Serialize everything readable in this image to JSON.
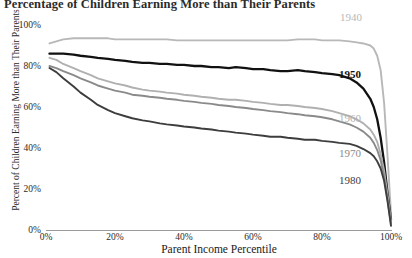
{
  "chart_data": {
    "type": "line",
    "title": "Percentage of Children Earning More than Their Parents",
    "xlabel": "Parent Income Percentile",
    "ylabel": "Percent of Children Earning More than Their Parents",
    "xlim": [
      0,
      100
    ],
    "ylim": [
      0,
      100
    ],
    "grid": false,
    "legend_position": "inline-right",
    "x_ticks": [
      "0%",
      "20%",
      "40%",
      "60%",
      "80%",
      "100%"
    ],
    "x_tick_values": [
      0,
      20,
      40,
      60,
      80,
      100
    ],
    "y_ticks": [
      "0%",
      "20%",
      "40%",
      "60%",
      "80%",
      "100%"
    ],
    "y_tick_values": [
      0,
      20,
      40,
      60,
      80,
      100
    ],
    "x": [
      1,
      3,
      5,
      8,
      10,
      13,
      15,
      18,
      20,
      23,
      25,
      28,
      30,
      33,
      35,
      38,
      40,
      43,
      45,
      48,
      50,
      53,
      55,
      58,
      60,
      63,
      65,
      68,
      70,
      73,
      75,
      78,
      80,
      83,
      85,
      88,
      90,
      92,
      94,
      95,
      96,
      97,
      98,
      99,
      100
    ],
    "series": [
      {
        "name": "1940",
        "color": "#b8b8b8",
        "label": "1940",
        "values": [
          91,
          92,
          93,
          93.5,
          93.5,
          93.5,
          93.5,
          93.5,
          93,
          93,
          93,
          93,
          93,
          93,
          93,
          92.5,
          92.5,
          92.5,
          92.5,
          92.5,
          92.5,
          92.5,
          92.5,
          92.5,
          92.5,
          92.5,
          92.5,
          92.5,
          92.5,
          93,
          93,
          93,
          92.5,
          92.5,
          92.5,
          92,
          91.5,
          91,
          90,
          88.5,
          85,
          78,
          62,
          36,
          8
        ]
      },
      {
        "name": "1950",
        "color": "#111111",
        "label": "1950",
        "values": [
          86,
          86,
          86,
          85.5,
          85,
          84.5,
          84,
          83.5,
          83,
          82.5,
          82,
          81.5,
          81.5,
          81,
          81,
          80.5,
          80.5,
          80,
          80,
          79.5,
          79.5,
          79,
          79.5,
          79,
          78.5,
          78.5,
          78,
          77.5,
          77.5,
          78,
          77.5,
          77,
          76.5,
          76,
          75.5,
          74,
          72,
          69,
          64,
          60,
          54,
          45,
          33,
          18,
          5
        ]
      },
      {
        "name": "1960",
        "color": "#b0b0b0",
        "label": "1960",
        "values": [
          84,
          83,
          81,
          79,
          77.5,
          75.5,
          74,
          72.5,
          71.5,
          70.5,
          69.5,
          68.5,
          68,
          67.5,
          67,
          66.5,
          66,
          65.5,
          65,
          64.5,
          64,
          63.5,
          63.5,
          63,
          62.5,
          62,
          61.5,
          61,
          61,
          60.5,
          60,
          59.5,
          59,
          58,
          57,
          55.5,
          54,
          52,
          49,
          46.5,
          43,
          37,
          29,
          17,
          4
        ]
      },
      {
        "name": "1970",
        "color": "#8a8a8a",
        "label": "1970",
        "values": [
          80,
          79,
          77.5,
          75.5,
          74,
          72,
          70.5,
          69,
          68,
          67,
          66,
          65.5,
          65,
          64.5,
          64,
          63.5,
          63,
          62.5,
          62,
          61.5,
          61,
          60.5,
          60,
          59.5,
          59,
          58.5,
          58,
          57.5,
          57,
          56.5,
          56,
          55.5,
          55,
          54,
          53,
          51.5,
          50,
          48,
          45,
          42.5,
          39,
          34,
          26,
          15,
          3
        ]
      },
      {
        "name": "1980",
        "color": "#3d3d3d",
        "label": "1980",
        "values": [
          79,
          77,
          74,
          70,
          67,
          63.5,
          61,
          58.5,
          57,
          55.5,
          54.5,
          53.5,
          53,
          52,
          51.5,
          51,
          50.5,
          50,
          49.5,
          49,
          48.5,
          48,
          47.5,
          47,
          46.5,
          46,
          45.5,
          45.5,
          45,
          44.5,
          44,
          44,
          43.5,
          43,
          42.5,
          42,
          41,
          39.5,
          37.5,
          36,
          33.5,
          30,
          24,
          14,
          2
        ]
      }
    ],
    "series_label_positions": [
      {
        "name": "1940",
        "x": 340,
        "y": 11,
        "color": "#b8b8b8",
        "bold": false
      },
      {
        "name": "1950",
        "x": 339,
        "y": 68,
        "color": "#111111",
        "bold": true
      },
      {
        "name": "1960",
        "x": 339,
        "y": 112,
        "color": "#b0b0b0",
        "bold": false
      },
      {
        "name": "1970",
        "x": 339,
        "y": 147,
        "color": "#8a8a8a",
        "bold": false
      },
      {
        "name": "1980",
        "x": 339,
        "y": 174,
        "color": "#3d3d3d",
        "bold": false
      }
    ]
  }
}
